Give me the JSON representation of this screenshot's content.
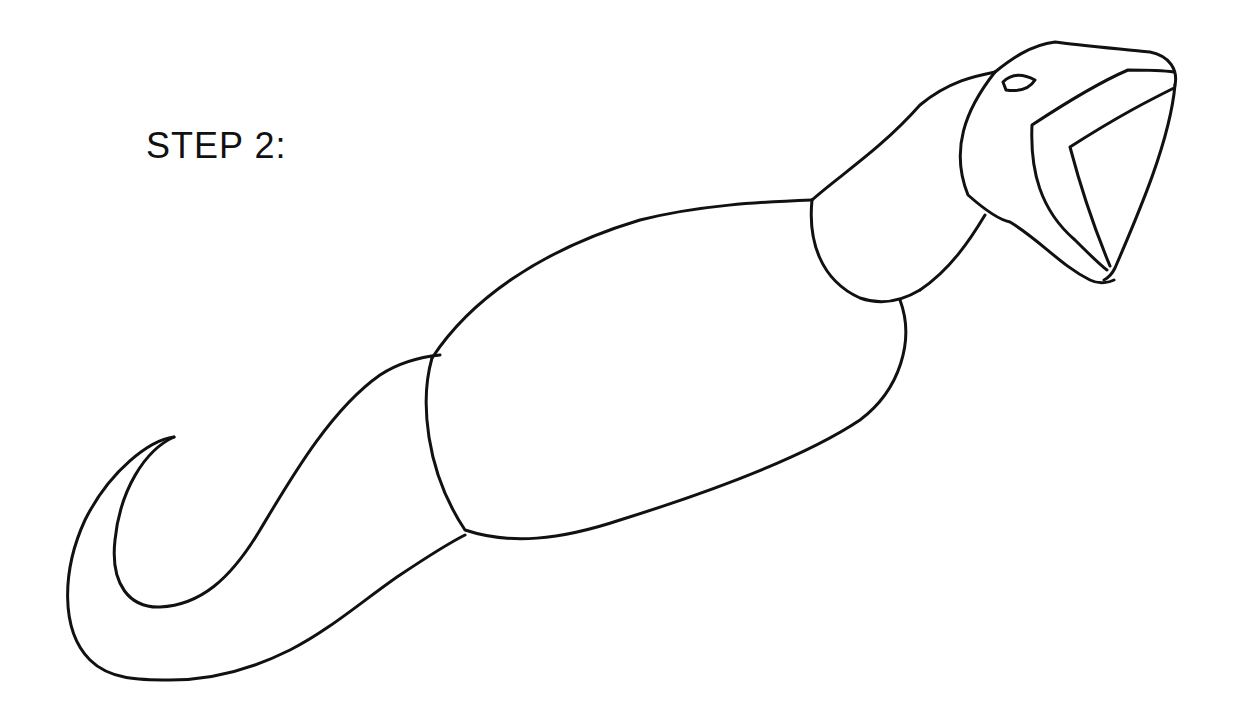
{
  "page": {
    "step_label": "STEP 2:",
    "ink_color": "#111111",
    "background_color": "#ffffff"
  },
  "drawing": {
    "subject": "snake",
    "parts": [
      {
        "name": "tail",
        "description": "curled hook-shaped tail"
      },
      {
        "name": "body",
        "description": "large oval body segment"
      },
      {
        "name": "neck",
        "description": "rounded neck segment"
      },
      {
        "name": "head",
        "description": "head with open mouth"
      },
      {
        "name": "eye",
        "description": "small almond eye outline"
      },
      {
        "name": "mouth",
        "description": "open jaw outline"
      }
    ]
  }
}
